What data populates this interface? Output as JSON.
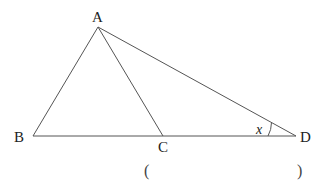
{
  "diagram": {
    "points": {
      "A": {
        "label": "A",
        "x": 98,
        "y": 27
      },
      "B": {
        "label": "B",
        "x": 33,
        "y": 136
      },
      "C": {
        "label": "C",
        "x": 163,
        "y": 136
      },
      "D": {
        "label": "D",
        "x": 296,
        "y": 136
      }
    },
    "segments": [
      "AB",
      "AC",
      "AD",
      "BD"
    ],
    "angle": {
      "vertex": "D",
      "label": "x"
    },
    "answer": {
      "open": "(",
      "close": ")",
      "value": ""
    }
  }
}
